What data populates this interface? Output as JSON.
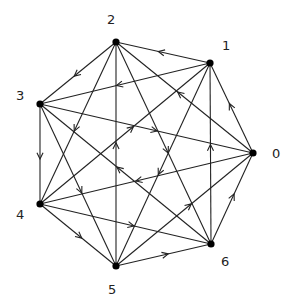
{
  "diagram": {
    "type": "directed-graph",
    "nodes": [
      {
        "id": "0",
        "label": "0",
        "x": 253,
        "y": 153,
        "lx": 272,
        "ly": 158
      },
      {
        "id": "1",
        "label": "1",
        "x": 210,
        "y": 63,
        "lx": 222,
        "ly": 50
      },
      {
        "id": "2",
        "label": "2",
        "x": 116,
        "y": 42,
        "lx": 107,
        "ly": 24
      },
      {
        "id": "3",
        "label": "3",
        "x": 40,
        "y": 104,
        "lx": 16,
        "ly": 100
      },
      {
        "id": "4",
        "label": "4",
        "x": 40,
        "y": 204,
        "lx": 16,
        "ly": 219
      },
      {
        "id": "5",
        "label": "5",
        "x": 116,
        "y": 266,
        "lx": 108,
        "ly": 294
      },
      {
        "id": "6",
        "label": "6",
        "x": 211,
        "y": 244,
        "lx": 221,
        "ly": 266
      }
    ],
    "edges": [
      {
        "from": "0",
        "to": "1"
      },
      {
        "from": "0",
        "to": "2"
      },
      {
        "from": "0",
        "to": "4"
      },
      {
        "from": "1",
        "to": "2"
      },
      {
        "from": "1",
        "to": "3"
      },
      {
        "from": "1",
        "to": "5"
      },
      {
        "from": "2",
        "to": "3"
      },
      {
        "from": "2",
        "to": "4"
      },
      {
        "from": "2",
        "to": "6"
      },
      {
        "from": "3",
        "to": "4"
      },
      {
        "from": "3",
        "to": "5"
      },
      {
        "from": "3",
        "to": "0"
      },
      {
        "from": "4",
        "to": "5"
      },
      {
        "from": "4",
        "to": "6"
      },
      {
        "from": "4",
        "to": "1"
      },
      {
        "from": "5",
        "to": "6"
      },
      {
        "from": "5",
        "to": "0"
      },
      {
        "from": "5",
        "to": "2"
      },
      {
        "from": "6",
        "to": "0"
      },
      {
        "from": "6",
        "to": "1"
      },
      {
        "from": "6",
        "to": "3"
      }
    ],
    "colors": {
      "edge": "#222222",
      "node": "#000000",
      "label": "#222222",
      "background": "#ffffff"
    }
  }
}
